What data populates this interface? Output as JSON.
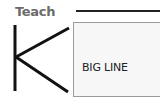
{
  "header": {
    "label": "Teach"
  },
  "logo": {
    "letter": "K",
    "icon": "k-letter-icon"
  },
  "card": {
    "label": "BIG LINE"
  }
}
